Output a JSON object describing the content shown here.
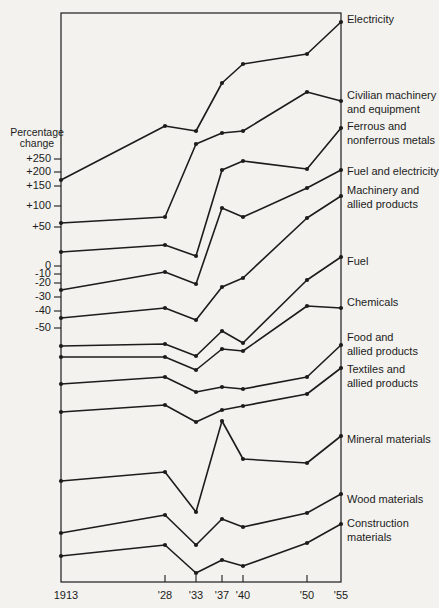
{
  "page": {
    "background": "#f3f2ee",
    "ink_color": "#1c1c1c"
  },
  "chart_data": {
    "type": "line",
    "title": "",
    "y_axis": {
      "label_lines": [
        "Percentage",
        "change"
      ],
      "label_x": 37,
      "label_y": 133,
      "ticks": [
        {
          "label": "+250",
          "y": 159
        },
        {
          "label": "+200",
          "y": 172
        },
        {
          "label": "+150",
          "y": 186
        },
        {
          "label": "+100",
          "y": 206
        },
        {
          "label": "+50",
          "y": 227
        },
        {
          "label": "0",
          "y": 266
        },
        {
          "label": "-10",
          "y": 274
        },
        {
          "label": "-20",
          "y": 283
        },
        {
          "label": "-30",
          "y": 297
        },
        {
          "label": "-40",
          "y": 311
        },
        {
          "label": "-50",
          "y": 328
        }
      ]
    },
    "x_axis": {
      "tick_labels": [
        "1913",
        "'28",
        "'33",
        "'37",
        "'40",
        "'50",
        "'55"
      ],
      "tick_x": [
        66,
        165,
        196,
        222,
        243,
        307,
        341
      ],
      "ticks_with_dash": [
        165,
        196,
        222,
        243,
        307
      ],
      "label_y": 596
    },
    "frame": {
      "left": 61,
      "top": 13,
      "right": 341,
      "bottom": 582
    },
    "x_categories": [
      "1913",
      "'28",
      "'33",
      "'37",
      "'40",
      "'50",
      "'55"
    ],
    "x_px": [
      61,
      165,
      196,
      222,
      243,
      307,
      341
    ],
    "series": [
      {
        "name": "Electricity",
        "label_lines": [
          "Electricity"
        ],
        "label_y": 20,
        "y_px": [
          180,
          126,
          131,
          83,
          64,
          54,
          22
        ]
      },
      {
        "name": "Civilian machinery and equipment",
        "label_lines": [
          "Civilian machinery",
          "and equipment"
        ],
        "label_y": 96,
        "y_px": [
          223,
          217,
          144,
          133,
          131,
          92,
          101
        ]
      },
      {
        "name": "Ferrous and nonferrous metals",
        "label_lines": [
          "Ferrous and",
          "nonferrous metals"
        ],
        "label_y": 127,
        "y_px": [
          252,
          245,
          256,
          170,
          161,
          169,
          128
        ]
      },
      {
        "name": "Fuel and electricity",
        "label_lines": [
          "Fuel and electricity"
        ],
        "label_y": 172,
        "y_px": [
          290,
          272,
          284,
          208,
          217,
          188,
          170
        ]
      },
      {
        "name": "Machinery and allied products",
        "label_lines": [
          "Machinery and",
          "allied products"
        ],
        "label_y": 191,
        "y_px": [
          318,
          308,
          320,
          287,
          278,
          218,
          196
        ]
      },
      {
        "name": "Fuel",
        "label_lines": [
          "Fuel"
        ],
        "label_y": 262,
        "y_px": [
          346,
          344,
          356,
          331,
          343,
          280,
          257
        ]
      },
      {
        "name": "Chemicals",
        "label_lines": [
          "Chemicals"
        ],
        "label_y": 303,
        "y_px": [
          357,
          357,
          370,
          349,
          351,
          306,
          308
        ]
      },
      {
        "name": "Food and allied products",
        "label_lines": [
          "Food and",
          "allied products"
        ],
        "label_y": 338,
        "y_px": [
          384,
          377,
          392,
          387,
          389,
          377,
          345
        ]
      },
      {
        "name": "Textiles and allied products",
        "label_lines": [
          "Textiles and",
          "allied products"
        ],
        "label_y": 370,
        "y_px": [
          412,
          405,
          422,
          410,
          406,
          394,
          368
        ]
      },
      {
        "name": "Mineral materials",
        "label_lines": [
          "Mineral materials"
        ],
        "label_y": 440,
        "y_px": [
          481,
          472,
          512,
          421,
          459,
          463,
          436
        ]
      },
      {
        "name": "Wood materials",
        "label_lines": [
          "Wood materials"
        ],
        "label_y": 500,
        "y_px": [
          533,
          515,
          545,
          519,
          527,
          513,
          494
        ]
      },
      {
        "name": "Construction materials",
        "label_lines": [
          "Construction",
          "materials"
        ],
        "label_y": 524,
        "y_px": [
          556,
          545,
          573,
          560,
          566,
          543,
          524
        ]
      }
    ],
    "series_label_x": 347,
    "legend_position": "right-of-line-endpoints",
    "grid": false
  }
}
